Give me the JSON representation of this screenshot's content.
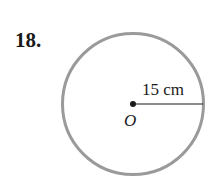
{
  "problem": {
    "number": "18."
  },
  "diagram": {
    "shape": "circle",
    "center_label": "O",
    "radius_label": "15 cm",
    "circle_stroke": "#9a9a9a",
    "line_color": "#1a1a1a"
  }
}
